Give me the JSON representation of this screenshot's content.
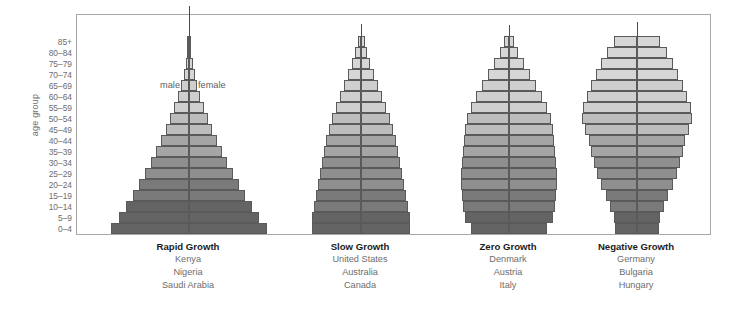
{
  "axis": {
    "y_title": "age group",
    "tick_labels": [
      "85+",
      "80–84",
      "75–79",
      "70–74",
      "65–69",
      "60–64",
      "55–59",
      "50–54",
      "45–49",
      "40–44",
      "35–39",
      "30–34",
      "25–29",
      "20–24",
      "15–19",
      "10–14",
      "5–9",
      "0–4"
    ]
  },
  "annotations": {
    "male": "male",
    "female": "female"
  },
  "colors": {
    "band_lightest": "#d6d6d6",
    "band_light": "#cfcfcf",
    "band_mid_light": "#bdbdbd",
    "band_mid": "#a5a5a5",
    "band_mid_dark": "#8f8f8f",
    "band_dark": "#7a7a7a",
    "band_darkest": "#646464",
    "bar_outline": "#5a5a5a",
    "center_line": "#4a4a4a",
    "frame_border": "#a8a8a8",
    "tick_text": "#6d6d6d",
    "title_text": "#1c1c1c"
  },
  "groups": [
    {
      "title": "Rapid Growth",
      "countries": [
        "Kenya",
        "Nigeria",
        "Saudi Arabia"
      ]
    },
    {
      "title": "Slow Growth",
      "countries": [
        "United States",
        "Australia",
        "Canada"
      ]
    },
    {
      "title": "Zero Growth",
      "countries": [
        "Denmark",
        "Austria",
        "Italy"
      ]
    },
    {
      "title": "Negative Growth",
      "countries": [
        "Germany",
        "Bulgaria",
        "Hungary"
      ]
    }
  ],
  "chart_data": {
    "type": "bar",
    "subtype": "population-pyramid",
    "title": "",
    "xlabel": "",
    "ylabel": "age group",
    "grid": false,
    "legend_position": "inline-center",
    "legend": [
      "male",
      "female"
    ],
    "categories": [
      "0–4",
      "5–9",
      "10–14",
      "15–19",
      "20–24",
      "25–29",
      "30–34",
      "35–39",
      "40–44",
      "45–49",
      "50–54",
      "55–59",
      "60–64",
      "65–69",
      "70–74",
      "75–79",
      "80–84",
      "85+"
    ],
    "note": "values are half-widths in pixels for each side (male = left, female = right); pyramids are symmetric",
    "pyramids": [
      {
        "name": "Rapid Growth",
        "countries": [
          "Kenya",
          "Nigeria",
          "Saudi Arabia"
        ],
        "half_widths": [
          78,
          70,
          63,
          56,
          50,
          44,
          38,
          33,
          28,
          23,
          19,
          15,
          11,
          8,
          5.5,
          3.5,
          2.2,
          1.2
        ],
        "shade_band": [
          6,
          6,
          6,
          5,
          5,
          4,
          4,
          3,
          3,
          2,
          2,
          1,
          1,
          1,
          0,
          0,
          0,
          0
        ],
        "spire_height": 30
      },
      {
        "name": "Slow Growth",
        "countries": [
          "United States",
          "Australia",
          "Canada"
        ],
        "half_widths": [
          49,
          49,
          47,
          45,
          43,
          41,
          39,
          37,
          35,
          32,
          29,
          25,
          21,
          17,
          13,
          9,
          6,
          3.5
        ],
        "shade_band": [
          6,
          6,
          5,
          5,
          4,
          4,
          4,
          3,
          3,
          2,
          2,
          1,
          1,
          1,
          0,
          0,
          0,
          0
        ],
        "spire_height": 12
      },
      {
        "name": "Zero Growth",
        "countries": [
          "Denmark",
          "Austria",
          "Italy"
        ],
        "half_widths": [
          38,
          44,
          46,
          47,
          48,
          48,
          47,
          46,
          45,
          44,
          42,
          38,
          33,
          27,
          21,
          15,
          9,
          5
        ],
        "shade_band": [
          6,
          6,
          5,
          5,
          4,
          4,
          4,
          3,
          3,
          2,
          2,
          1,
          1,
          1,
          0,
          0,
          0,
          0
        ],
        "spire_height": 11
      },
      {
        "name": "Negative Growth",
        "countries": [
          "Germany",
          "Bulgaria",
          "Hungary"
        ],
        "half_widths": [
          22,
          23,
          27,
          31,
          36,
          40,
          43,
          46,
          48,
          52,
          55,
          54,
          50,
          46,
          41,
          36,
          30,
          23
        ],
        "shade_band": [
          6,
          6,
          5,
          5,
          4,
          4,
          4,
          3,
          3,
          2,
          2,
          1,
          1,
          1,
          0,
          0,
          0,
          0
        ],
        "spire_height": 14
      }
    ]
  }
}
